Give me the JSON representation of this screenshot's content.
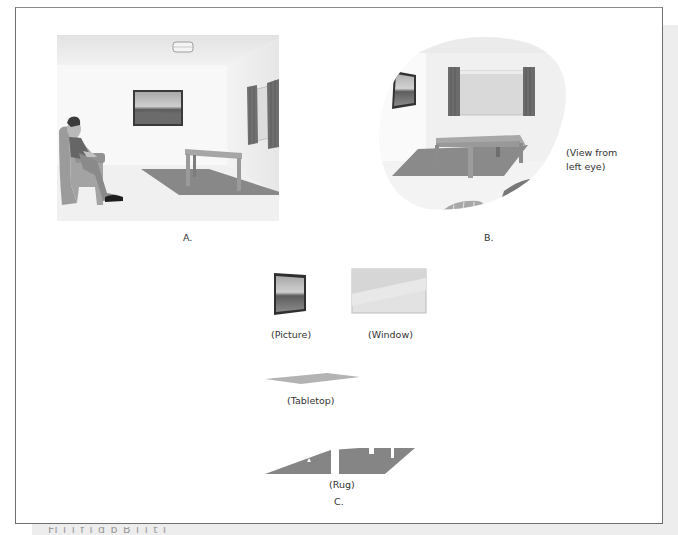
{
  "figure": {
    "panel_a": {
      "label": "A."
    },
    "panel_b": {
      "label": "B.",
      "annotation_line1": "(View from",
      "annotation_line2": "left eye)"
    },
    "panel_c": {
      "label": "C.",
      "items": [
        {
          "name": "picture",
          "label": "(Picture)"
        },
        {
          "name": "window",
          "label": "(Window)"
        },
        {
          "name": "tabletop",
          "label": "(Tabletop)"
        },
        {
          "name": "rug",
          "label": "(Rug)"
        }
      ]
    },
    "caption_fragment": "Fi                    i  l  f  i      d      b      B   i   l  t  i"
  },
  "colors": {
    "wall_back": "#f7f7f7",
    "wall_side": "#eeeeee",
    "ceiling": "#e9e9e9",
    "floor": "#f1f1f1",
    "rug": "#8a8a8a",
    "table": "#a3a3a3",
    "curtain": "#6e6e6e",
    "chair": "#9a9a9a",
    "frame_border": "#6f6f6f"
  }
}
